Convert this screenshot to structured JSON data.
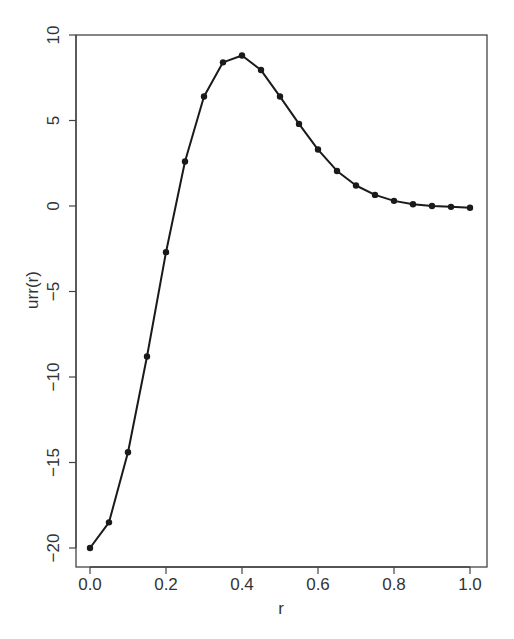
{
  "chart_data": {
    "type": "line",
    "title": "",
    "xlabel": "r",
    "ylabel": "urr(r)",
    "xlim": [
      0.0,
      1.0
    ],
    "ylim": [
      -20,
      10
    ],
    "grid": false,
    "legend": null,
    "markers": true,
    "x_ticks": [
      "0.0",
      "0.2",
      "0.4",
      "0.6",
      "0.8",
      "1.0"
    ],
    "y_ticks": [
      "-20",
      "-15",
      "-10",
      "-5",
      "0",
      "5",
      "10"
    ],
    "x": [
      0.0,
      0.05,
      0.1,
      0.15,
      0.2,
      0.25,
      0.3,
      0.35,
      0.4,
      0.45,
      0.5,
      0.55,
      0.6,
      0.65,
      0.7,
      0.75,
      0.8,
      0.85,
      0.9,
      0.95,
      1.0
    ],
    "series": [
      {
        "name": "urr(r)",
        "values": [
          -20.0,
          -18.5,
          -14.4,
          -8.8,
          -2.7,
          2.6,
          6.4,
          8.4,
          8.8,
          7.95,
          6.4,
          4.8,
          3.3,
          2.05,
          1.2,
          0.65,
          0.3,
          0.1,
          0.0,
          -0.05,
          -0.1
        ],
        "color": "#1a1a1a"
      }
    ]
  },
  "axes": {
    "x_label": "r",
    "y_label": "urr(r)",
    "x_tick_labels": [
      "0.0",
      "0.2",
      "0.4",
      "0.6",
      "0.8",
      "1.0"
    ],
    "y_tick_labels": [
      "-20",
      "-15",
      "-10",
      "-5",
      "0",
      "5",
      "10"
    ]
  }
}
